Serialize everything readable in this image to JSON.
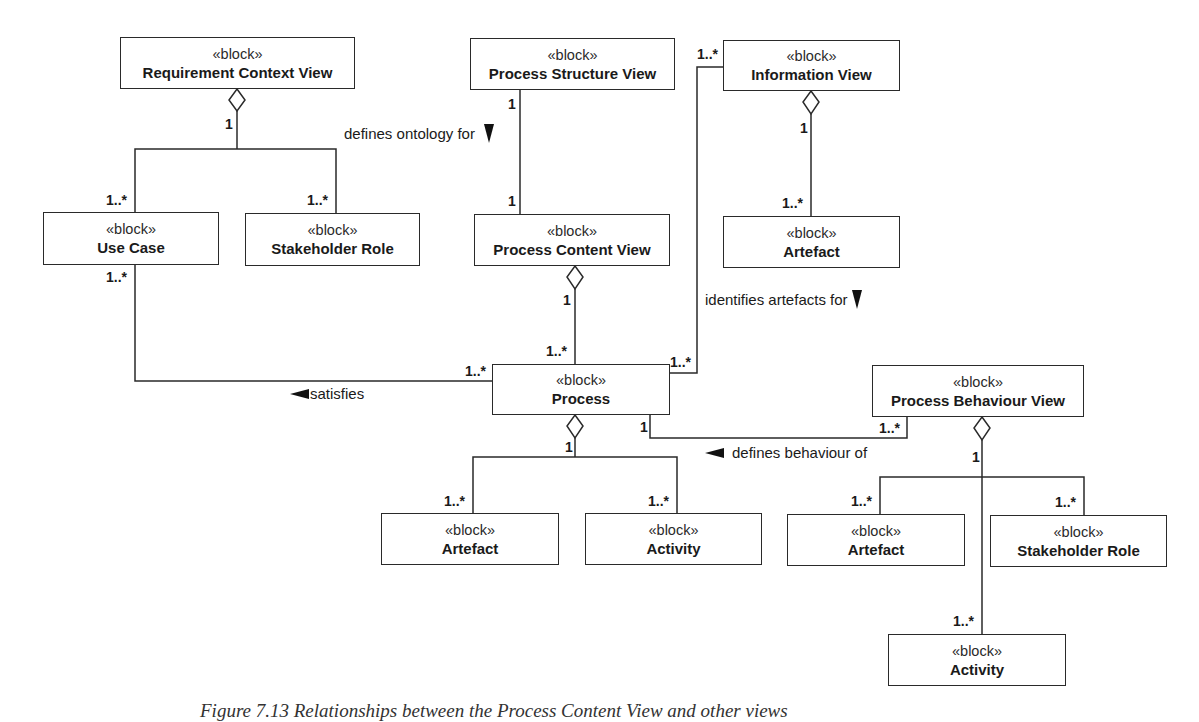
{
  "stereotype": "«block»",
  "blocks": {
    "requirement_context_view": "Requirement Context View",
    "use_case": "Use Case",
    "stakeholder_role_left": "Stakeholder Role",
    "process_structure_view": "Process Structure View",
    "process_content_view": "Process Content View",
    "information_view": "Information View",
    "artefact_info": "Artefact",
    "process": "Process",
    "artefact_process": "Artefact",
    "activity_process": "Activity",
    "process_behaviour_view": "Process Behaviour View",
    "artefact_behaviour": "Artefact",
    "stakeholder_role_behaviour": "Stakeholder Role",
    "activity_behaviour": "Activity"
  },
  "associations": {
    "defines_ontology_for": "defines ontology for",
    "identifies_artefacts_for": "identifies artefacts for",
    "satisfies": "satisfies",
    "defines_behaviour_of": "defines behaviour of"
  },
  "multiplicities": {
    "one": "1",
    "one_to_many": "1..*"
  },
  "caption": "Figure 7.13   Relationships between the Process Content View and other views"
}
